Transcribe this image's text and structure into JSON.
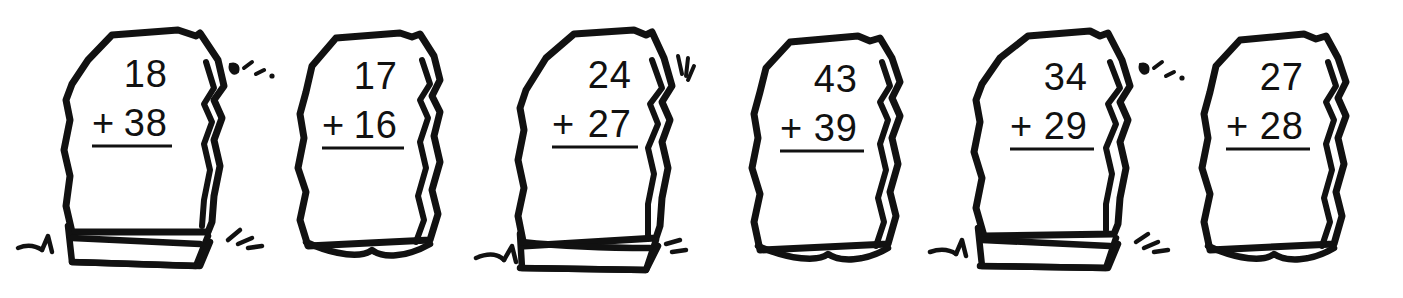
{
  "worksheet": {
    "title": "Two-digit addition problems on stones",
    "background_color": "#ffffff",
    "ink_color": "#111111",
    "operator": "+",
    "problem_count": 6
  },
  "problems": [
    {
      "id": "stone-1",
      "top_addend": "18",
      "plus": "+",
      "bottom_addend": "38",
      "has_base_block": true,
      "has_grass": true,
      "has_sparkles": true
    },
    {
      "id": "stone-2",
      "top_addend": "17",
      "plus": "+",
      "bottom_addend": "16",
      "has_base_block": false,
      "has_grass": false,
      "has_sparkles": false
    },
    {
      "id": "stone-3",
      "top_addend": "24",
      "plus": "+",
      "bottom_addend": "27",
      "has_base_block": true,
      "has_grass": true,
      "has_sparkles": true
    },
    {
      "id": "stone-4",
      "top_addend": "43",
      "plus": "+",
      "bottom_addend": "39",
      "has_base_block": false,
      "has_grass": false,
      "has_sparkles": false
    },
    {
      "id": "stone-5",
      "top_addend": "34",
      "plus": "+",
      "bottom_addend": "29",
      "has_base_block": true,
      "has_grass": true,
      "has_sparkles": true
    },
    {
      "id": "stone-6",
      "top_addend": "27",
      "plus": "+",
      "bottom_addend": "28",
      "has_base_block": false,
      "has_grass": false,
      "has_sparkles": false
    }
  ]
}
